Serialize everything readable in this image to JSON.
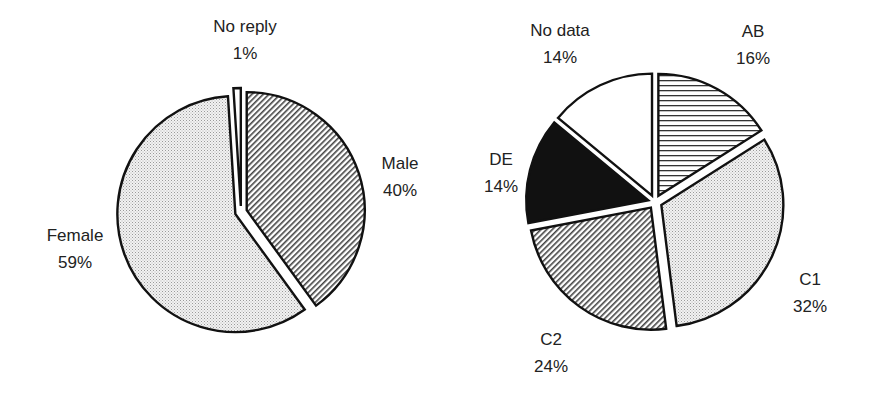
{
  "chart_data": [
    {
      "type": "pie",
      "title": "",
      "categories": [
        "No reply",
        "Male",
        "Female"
      ],
      "values": [
        1,
        40,
        59
      ],
      "labels": [
        {
          "name": "No reply",
          "pct": "1%"
        },
        {
          "name": "Male",
          "pct": "40%"
        },
        {
          "name": "Female",
          "pct": "59%"
        }
      ],
      "patterns": [
        "white",
        "diagonal-hatch",
        "fine-dots"
      ],
      "exploded": true
    },
    {
      "type": "pie",
      "title": "",
      "categories": [
        "AB",
        "C1",
        "C2",
        "DE",
        "No data"
      ],
      "values": [
        16,
        32,
        24,
        14,
        14
      ],
      "labels": [
        {
          "name": "AB",
          "pct": "16%"
        },
        {
          "name": "C1",
          "pct": "32%"
        },
        {
          "name": "C2",
          "pct": "24%"
        },
        {
          "name": "DE",
          "pct": "14%"
        },
        {
          "name": "No data",
          "pct": "14%"
        }
      ],
      "patterns": [
        "horizontal-lines",
        "fine-dots",
        "diagonal-hatch",
        "solid-black",
        "white"
      ],
      "exploded": true
    }
  ]
}
